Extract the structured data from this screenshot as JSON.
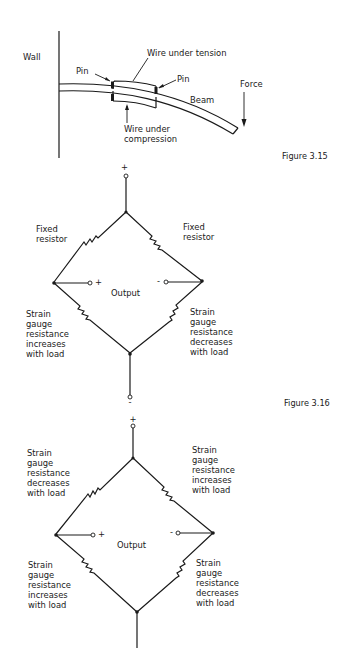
{
  "figure_3_15": {
    "caption": "Figure 3.15",
    "labels": {
      "wall": "Wall",
      "wire_tension": "Wire under tension",
      "pin_left": "Pin",
      "pin_right": "Pin",
      "beam": "Beam",
      "force": "Force",
      "wire_compression_1": "Wire under",
      "wire_compression_2": "compression"
    }
  },
  "figure_3_16": {
    "caption": "Figure 3.16",
    "bridge_top": {
      "top_terminal": "+",
      "bottom_terminal": "-",
      "output_label": "Output",
      "output_plus": "+",
      "output_minus": "-",
      "upper_left": [
        "Fixed",
        "resistor"
      ],
      "upper_right": [
        "Fixed",
        "resistor"
      ],
      "lower_left": [
        "Strain",
        "gauge",
        "resistance",
        "increases",
        "with load"
      ],
      "lower_right": [
        "Strain",
        "gauge",
        "resistance",
        "decreases",
        "with load"
      ]
    },
    "bridge_bottom": {
      "top_terminal": "+",
      "output_label": "Output",
      "output_plus": "+",
      "output_minus": "-",
      "upper_left": [
        "Strain",
        "gauge",
        "resistance",
        "decreases",
        "with load"
      ],
      "upper_right": [
        "Strain",
        "gauge",
        "resistance",
        "increases",
        "with load"
      ],
      "lower_left": [
        "Strain",
        "gauge",
        "resistance",
        "increases",
        "with load"
      ],
      "lower_right": [
        "Strain",
        "gauge",
        "resistance",
        "decreases",
        "with load"
      ]
    }
  }
}
